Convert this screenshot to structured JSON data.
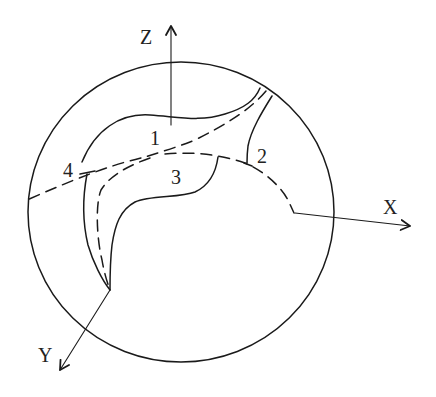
{
  "diagram": {
    "type": "3D sphere with curved surface regions and coordinate axes",
    "axes": {
      "z": {
        "label": "Z"
      },
      "x": {
        "label": "X"
      },
      "y": {
        "label": "Y"
      }
    },
    "regions": [
      {
        "id": "1",
        "label": "1"
      },
      {
        "id": "2",
        "label": "2"
      },
      {
        "id": "3",
        "label": "3"
      },
      {
        "id": "4",
        "label": "4"
      }
    ],
    "colors": {
      "line": "#1a1a1a",
      "background": "#ffffff"
    }
  }
}
